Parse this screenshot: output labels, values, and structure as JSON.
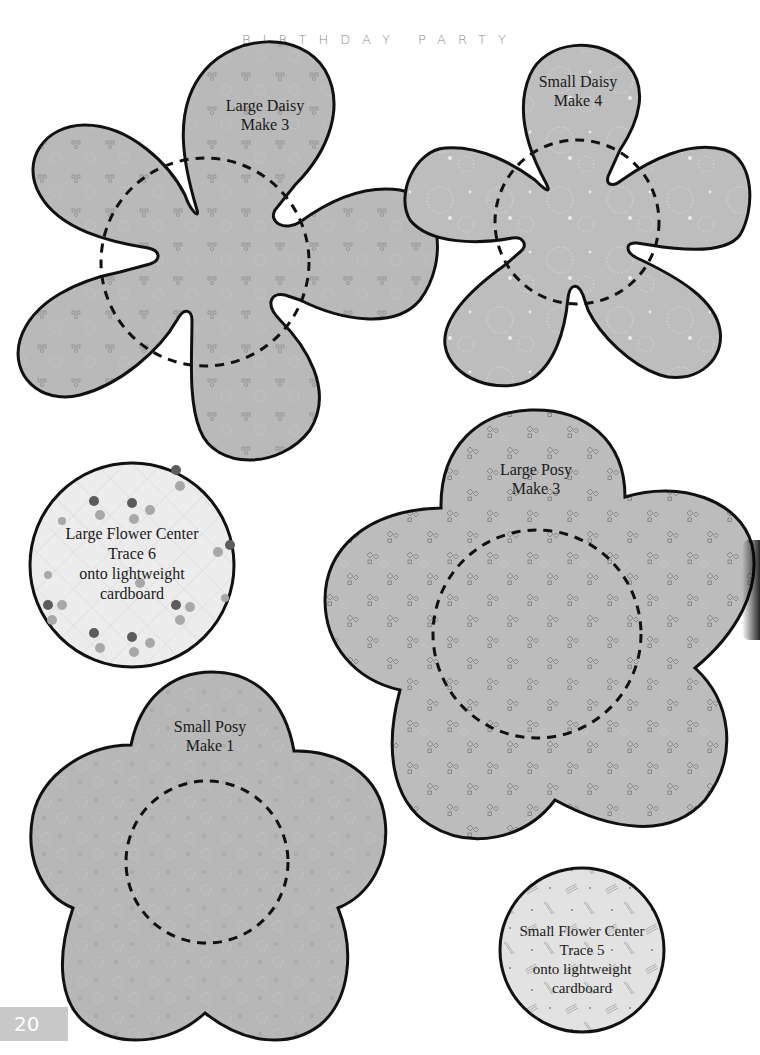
{
  "header": {
    "title": "BIRTHDAY PARTY"
  },
  "page": {
    "number": "20"
  },
  "templates": [
    {
      "id": "large-daisy",
      "name": "Large Daisy",
      "instruction": "Make 3"
    },
    {
      "id": "small-daisy",
      "name": "Small Daisy",
      "instruction": "Make 4"
    },
    {
      "id": "large-flower-center",
      "name": "Large Flower Center",
      "instruction": "Trace 6",
      "note_1": "onto lightweight",
      "note_2": "cardboard"
    },
    {
      "id": "large-posy",
      "name": "Large Posy",
      "instruction": "Make 3"
    },
    {
      "id": "small-posy",
      "name": "Small Posy",
      "instruction": "Make 1"
    },
    {
      "id": "small-flower-center",
      "name": "Small Flower Center",
      "instruction": "Trace 5",
      "note_1": "onto lightweight",
      "note_2": "cardboard"
    }
  ],
  "colors": {
    "fabric_gray": "#b9b9b9",
    "center_fill": "#e6e6e6",
    "outline": "#111111",
    "header_text": "#8a8a8a",
    "page_tab": "#c8c8c8"
  }
}
